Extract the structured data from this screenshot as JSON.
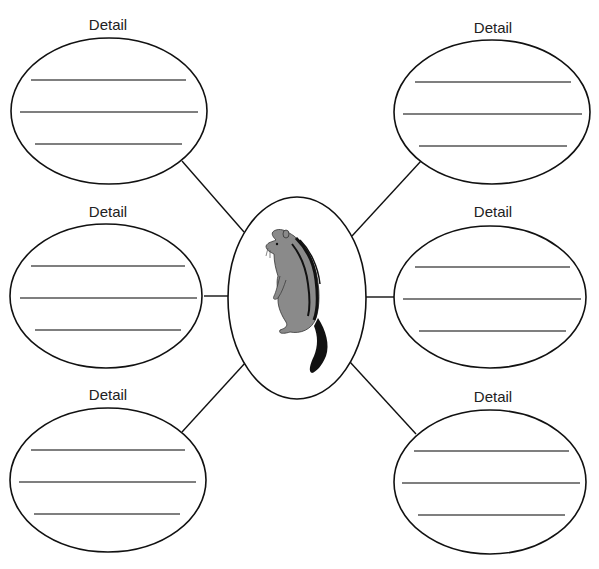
{
  "diagram": {
    "type": "graphic-organizer-web",
    "center": {
      "image": "chipmunk-illustration",
      "cx": 297,
      "cy": 298,
      "rx": 69,
      "ry": 101
    },
    "details": [
      {
        "label": "Detail",
        "position": "top-left",
        "cx": 109,
        "cy": 111,
        "rx": 98,
        "ry": 73,
        "label_x": 108,
        "label_y": 16,
        "lines": 3
      },
      {
        "label": "Detail",
        "position": "top-right",
        "cx": 492,
        "cy": 112,
        "rx": 98,
        "ry": 72,
        "label_x": 493,
        "label_y": 19,
        "lines": 3
      },
      {
        "label": "Detail",
        "position": "middle-left",
        "cx": 106,
        "cy": 296,
        "rx": 96,
        "ry": 72,
        "label_x": 108,
        "label_y": 203,
        "lines": 3
      },
      {
        "label": "Detail",
        "position": "middle-right",
        "cx": 490,
        "cy": 297,
        "rx": 96,
        "ry": 71,
        "label_x": 493,
        "label_y": 203,
        "lines": 3
      },
      {
        "label": "Detail",
        "position": "bottom-left",
        "cx": 108,
        "cy": 480,
        "rx": 98,
        "ry": 72,
        "label_x": 108,
        "label_y": 386,
        "lines": 3
      },
      {
        "label": "Detail",
        "position": "bottom-right",
        "cx": 490,
        "cy": 482,
        "rx": 96,
        "ry": 72,
        "label_x": 493,
        "label_y": 388,
        "lines": 3
      }
    ],
    "colors": {
      "stroke": "#111111",
      "writing_line": "#555555",
      "animal_body": "#8a8a8a",
      "animal_dark": "#111111",
      "background": "#ffffff"
    }
  }
}
